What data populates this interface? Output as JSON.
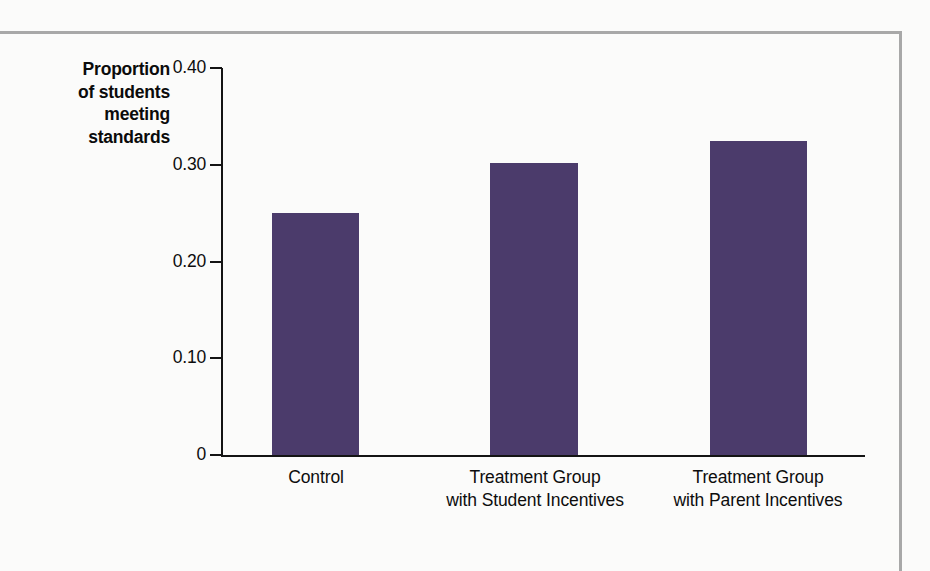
{
  "chart_data": {
    "type": "bar",
    "title": "",
    "subtitle": "",
    "xlabel": "",
    "ylabel": "Proportion of students meeting standards",
    "ylabel_lines": [
      "Proportion",
      "of students",
      "meeting",
      "standards"
    ],
    "categories": [
      "Control",
      "Treatment Group with Student Incentives",
      "Treatment Group with Parent Incentives"
    ],
    "category_lines": [
      [
        "Control"
      ],
      [
        "Treatment Group",
        "with Student Incentives"
      ],
      [
        "Treatment Group",
        "with Parent Incentives"
      ]
    ],
    "values": [
      0.25,
      0.302,
      0.325
    ],
    "ylim": [
      0,
      0.4
    ],
    "yticks": [
      0,
      0.1,
      0.2,
      0.3,
      0.4
    ],
    "ytick_labels": [
      "0",
      "0.10",
      "0.20",
      "0.30",
      "0.40"
    ],
    "grid": false,
    "legend": false,
    "bar_color": "#4b3b6b",
    "axis_color": "#141414",
    "background_color": "#fbfbfa"
  }
}
